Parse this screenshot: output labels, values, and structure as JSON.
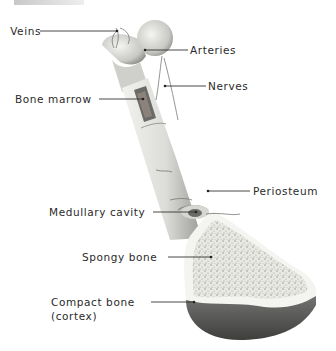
{
  "diagram": {
    "labels": {
      "veins": "Veins",
      "arteries": "Arteries",
      "nerves": "Nerves",
      "bone_marrow": "Bone marrow",
      "periosteum": "Periosteum",
      "medullary_cavity": "Medullary cavity",
      "spongy_bone": "Spongy bone",
      "compact_bone_line1": "Compact bone",
      "compact_bone_line2": "(cortex)"
    },
    "colors": {
      "label_text": "#2a2a2a",
      "leader_line": "#333333",
      "bone_light": "#e6e6e2",
      "bone_shadow": "#8c8c88",
      "cortex_dark": "#5a5a58"
    }
  }
}
